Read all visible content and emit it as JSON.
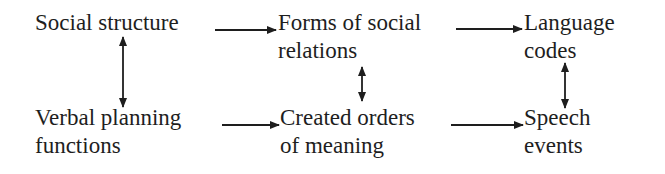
{
  "diagram": {
    "nodes": [
      {
        "id": "social-structure",
        "lines": [
          "Social structure",
          ""
        ]
      },
      {
        "id": "forms-of-social-relations",
        "lines": [
          "Forms of social",
          "relations"
        ]
      },
      {
        "id": "language-codes",
        "lines": [
          "Language",
          "codes"
        ]
      },
      {
        "id": "verbal-planning-functions",
        "lines": [
          "Verbal planning",
          "functions"
        ]
      },
      {
        "id": "created-orders-of-meaning",
        "lines": [
          "Created orders",
          "of meaning"
        ]
      },
      {
        "id": "speech-events",
        "lines": [
          "Speech",
          "events"
        ]
      }
    ],
    "edges": [
      {
        "from": "social-structure",
        "to": "forms-of-social-relations",
        "type": "one-way"
      },
      {
        "from": "forms-of-social-relations",
        "to": "language-codes",
        "type": "one-way"
      },
      {
        "from": "verbal-planning-functions",
        "to": "created-orders-of-meaning",
        "type": "one-way"
      },
      {
        "from": "created-orders-of-meaning",
        "to": "speech-events",
        "type": "one-way"
      },
      {
        "from": "social-structure",
        "to": "verbal-planning-functions",
        "type": "two-way"
      },
      {
        "from": "forms-of-social-relations",
        "to": "created-orders-of-meaning",
        "type": "two-way"
      },
      {
        "from": "language-codes",
        "to": "speech-events",
        "type": "two-way"
      }
    ],
    "colors": {
      "ink": "#1e1e1e",
      "background": "#ffffff"
    }
  }
}
